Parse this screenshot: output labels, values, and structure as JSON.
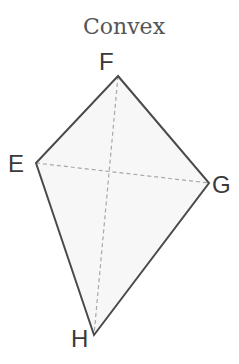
{
  "title": "Convex",
  "shape": "quadrilateral (kite)",
  "colors": {
    "edge": "#4a4a4a",
    "diagonal": "#a8a8a8",
    "fill": "#f7f7f7",
    "label": "#3a3a3a"
  },
  "vertices": [
    {
      "name": "F",
      "label": "F",
      "x": 118,
      "y": 76,
      "lx": 99,
      "ly": 70
    },
    {
      "name": "E",
      "label": "E",
      "x": 36,
      "y": 163,
      "lx": 8,
      "ly": 172
    },
    {
      "name": "G",
      "label": "G",
      "x": 209,
      "y": 183,
      "lx": 212,
      "ly": 193
    },
    {
      "name": "H",
      "label": "H",
      "x": 94,
      "y": 335,
      "lx": 71,
      "ly": 347
    }
  ],
  "diagonals": [
    [
      "F",
      "H"
    ],
    [
      "E",
      "G"
    ]
  ]
}
